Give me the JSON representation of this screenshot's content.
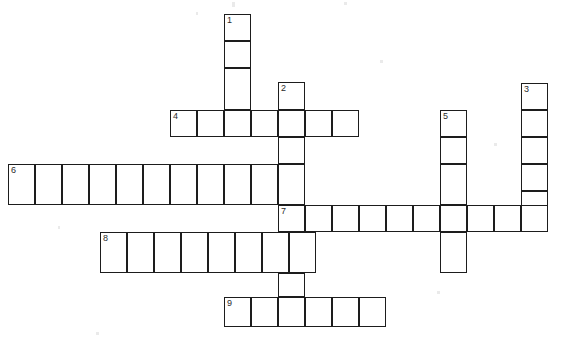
{
  "puzzle": {
    "kind": "crossword-grid",
    "title": "",
    "background_color": "#ffffff",
    "line_color": "#1d1d1d",
    "number_color": "#2b2b2b",
    "cell_size": 27,
    "grid_origin_x": 8,
    "grid_origin_y": 14,
    "canvas_width": 569,
    "canvas_height": 345,
    "entries": [
      {
        "number": "1",
        "direction": "down",
        "length": 4,
        "start_x": 224,
        "start_y": 14,
        "answer": ""
      },
      {
        "number": "2",
        "direction": "down",
        "length": 9,
        "start_x": 278,
        "start_y": 82,
        "answer": ""
      },
      {
        "number": "3",
        "direction": "down",
        "length": 5,
        "start_x": 521,
        "start_y": 83,
        "answer": ""
      },
      {
        "number": "4",
        "direction": "across",
        "length": 7,
        "start_x": 170,
        "start_y": 110,
        "answer": ""
      },
      {
        "number": "5",
        "direction": "down",
        "length": 5,
        "start_x": 440,
        "start_y": 110,
        "answer": ""
      },
      {
        "number": "6",
        "direction": "across",
        "length": 10,
        "start_x": 8,
        "start_y": 164,
        "answer": ""
      },
      {
        "number": "7",
        "direction": "across",
        "length": 10,
        "start_x": 278,
        "start_y": 205,
        "answer": ""
      },
      {
        "number": "8",
        "direction": "across",
        "length": 8,
        "start_x": 100,
        "start_y": 232,
        "answer": ""
      },
      {
        "number": "9",
        "direction": "across",
        "length": 6,
        "start_x": 224,
        "start_y": 297,
        "answer": ""
      }
    ],
    "cells": [
      {
        "x": 224,
        "y": 14,
        "w": 27,
        "h": 27,
        "number": "1",
        "letter": ""
      },
      {
        "x": 224,
        "y": 41,
        "w": 27,
        "h": 27,
        "number": "",
        "letter": ""
      },
      {
        "x": 224,
        "y": 68,
        "w": 27,
        "h": 42,
        "number": "",
        "letter": ""
      },
      {
        "x": 278,
        "y": 82,
        "w": 27,
        "h": 28,
        "number": "2",
        "letter": ""
      },
      {
        "x": 521,
        "y": 83,
        "w": 27,
        "h": 27,
        "number": "3",
        "letter": ""
      },
      {
        "x": 521,
        "y": 110,
        "w": 27,
        "h": 27,
        "number": "",
        "letter": ""
      },
      {
        "x": 521,
        "y": 137,
        "w": 27,
        "h": 27,
        "number": "",
        "letter": ""
      },
      {
        "x": 521,
        "y": 164,
        "w": 27,
        "h": 27,
        "number": "",
        "letter": ""
      },
      {
        "x": 521,
        "y": 191,
        "w": 27,
        "h": 27,
        "number": "",
        "letter": ""
      },
      {
        "x": 170,
        "y": 110,
        "w": 27,
        "h": 27,
        "number": "4",
        "letter": ""
      },
      {
        "x": 197,
        "y": 110,
        "w": 27,
        "h": 27,
        "number": "",
        "letter": ""
      },
      {
        "x": 224,
        "y": 110,
        "w": 27,
        "h": 27,
        "number": "",
        "letter": ""
      },
      {
        "x": 251,
        "y": 110,
        "w": 27,
        "h": 27,
        "number": "",
        "letter": ""
      },
      {
        "x": 278,
        "y": 110,
        "w": 27,
        "h": 27,
        "number": "",
        "letter": ""
      },
      {
        "x": 305,
        "y": 110,
        "w": 27,
        "h": 27,
        "number": "",
        "letter": ""
      },
      {
        "x": 332,
        "y": 110,
        "w": 27,
        "h": 27,
        "number": "",
        "letter": ""
      },
      {
        "x": 440,
        "y": 110,
        "w": 27,
        "h": 27,
        "number": "5",
        "letter": ""
      },
      {
        "x": 440,
        "y": 137,
        "w": 27,
        "h": 27,
        "number": "",
        "letter": ""
      },
      {
        "x": 440,
        "y": 164,
        "w": 27,
        "h": 41,
        "number": "",
        "letter": ""
      },
      {
        "x": 440,
        "y": 232,
        "w": 27,
        "h": 41,
        "number": "",
        "letter": ""
      },
      {
        "x": 278,
        "y": 137,
        "w": 27,
        "h": 27,
        "number": "",
        "letter": ""
      },
      {
        "x": 278,
        "y": 164,
        "w": 27,
        "h": 41,
        "number": "",
        "letter": ""
      },
      {
        "x": 8,
        "y": 164,
        "w": 27,
        "h": 41,
        "number": "6",
        "letter": ""
      },
      {
        "x": 35,
        "y": 164,
        "w": 27,
        "h": 41,
        "number": "",
        "letter": ""
      },
      {
        "x": 62,
        "y": 164,
        "w": 27,
        "h": 41,
        "number": "",
        "letter": ""
      },
      {
        "x": 89,
        "y": 164,
        "w": 27,
        "h": 41,
        "number": "",
        "letter": ""
      },
      {
        "x": 116,
        "y": 164,
        "w": 27,
        "h": 41,
        "number": "",
        "letter": ""
      },
      {
        "x": 143,
        "y": 164,
        "w": 27,
        "h": 41,
        "number": "",
        "letter": ""
      },
      {
        "x": 170,
        "y": 164,
        "w": 27,
        "h": 41,
        "number": "",
        "letter": ""
      },
      {
        "x": 197,
        "y": 164,
        "w": 27,
        "h": 41,
        "number": "",
        "letter": ""
      },
      {
        "x": 224,
        "y": 164,
        "w": 27,
        "h": 41,
        "number": "",
        "letter": ""
      },
      {
        "x": 251,
        "y": 164,
        "w": 27,
        "h": 41,
        "number": "",
        "letter": ""
      },
      {
        "x": 278,
        "y": 205,
        "w": 27,
        "h": 27,
        "number": "7",
        "letter": ""
      },
      {
        "x": 305,
        "y": 205,
        "w": 27,
        "h": 27,
        "number": "",
        "letter": ""
      },
      {
        "x": 332,
        "y": 205,
        "w": 27,
        "h": 27,
        "number": "",
        "letter": ""
      },
      {
        "x": 359,
        "y": 205,
        "w": 27,
        "h": 27,
        "number": "",
        "letter": ""
      },
      {
        "x": 386,
        "y": 205,
        "w": 27,
        "h": 27,
        "number": "",
        "letter": ""
      },
      {
        "x": 413,
        "y": 205,
        "w": 27,
        "h": 27,
        "number": "",
        "letter": ""
      },
      {
        "x": 440,
        "y": 205,
        "w": 27,
        "h": 27,
        "number": "",
        "letter": ""
      },
      {
        "x": 467,
        "y": 205,
        "w": 27,
        "h": 27,
        "number": "",
        "letter": ""
      },
      {
        "x": 494,
        "y": 205,
        "w": 27,
        "h": 27,
        "number": "",
        "letter": ""
      },
      {
        "x": 521,
        "y": 205,
        "w": 27,
        "h": 27,
        "number": "",
        "letter": ""
      },
      {
        "x": 100,
        "y": 232,
        "w": 27,
        "h": 41,
        "number": "8",
        "letter": ""
      },
      {
        "x": 127,
        "y": 232,
        "w": 27,
        "h": 41,
        "number": "",
        "letter": ""
      },
      {
        "x": 154,
        "y": 232,
        "w": 27,
        "h": 41,
        "number": "",
        "letter": ""
      },
      {
        "x": 181,
        "y": 232,
        "w": 27,
        "h": 41,
        "number": "",
        "letter": ""
      },
      {
        "x": 208,
        "y": 232,
        "w": 27,
        "h": 41,
        "number": "",
        "letter": ""
      },
      {
        "x": 235,
        "y": 232,
        "w": 27,
        "h": 41,
        "number": "",
        "letter": ""
      },
      {
        "x": 262,
        "y": 232,
        "w": 27,
        "h": 41,
        "number": "",
        "letter": ""
      },
      {
        "x": 289,
        "y": 232,
        "w": 27,
        "h": 41,
        "number": "",
        "letter": ""
      },
      {
        "x": 278,
        "y": 273,
        "w": 27,
        "h": 24,
        "number": "",
        "letter": ""
      },
      {
        "x": 224,
        "y": 297,
        "w": 27,
        "h": 30,
        "number": "9",
        "letter": ""
      },
      {
        "x": 251,
        "y": 297,
        "w": 27,
        "h": 30,
        "number": "",
        "letter": ""
      },
      {
        "x": 278,
        "y": 297,
        "w": 27,
        "h": 30,
        "number": "",
        "letter": ""
      },
      {
        "x": 305,
        "y": 297,
        "w": 27,
        "h": 30,
        "number": "",
        "letter": ""
      },
      {
        "x": 332,
        "y": 297,
        "w": 27,
        "h": 30,
        "number": "",
        "letter": ""
      },
      {
        "x": 359,
        "y": 297,
        "w": 27,
        "h": 30,
        "number": "",
        "letter": ""
      }
    ],
    "artifacts": [
      {
        "x": 232,
        "y": 2,
        "w": 3,
        "h": 5
      },
      {
        "x": 247,
        "y": 36,
        "w": 3,
        "h": 3
      },
      {
        "x": 196,
        "y": 12,
        "w": 2,
        "h": 3
      },
      {
        "x": 380,
        "y": 60,
        "w": 3,
        "h": 3
      },
      {
        "x": 494,
        "y": 143,
        "w": 3,
        "h": 3
      },
      {
        "x": 380,
        "y": 214,
        "w": 3,
        "h": 3
      },
      {
        "x": 437,
        "y": 291,
        "w": 3,
        "h": 3
      },
      {
        "x": 96,
        "y": 332,
        "w": 3,
        "h": 3
      },
      {
        "x": 344,
        "y": 2,
        "w": 3,
        "h": 3
      },
      {
        "x": 58,
        "y": 226,
        "w": 2,
        "h": 3
      }
    ]
  }
}
